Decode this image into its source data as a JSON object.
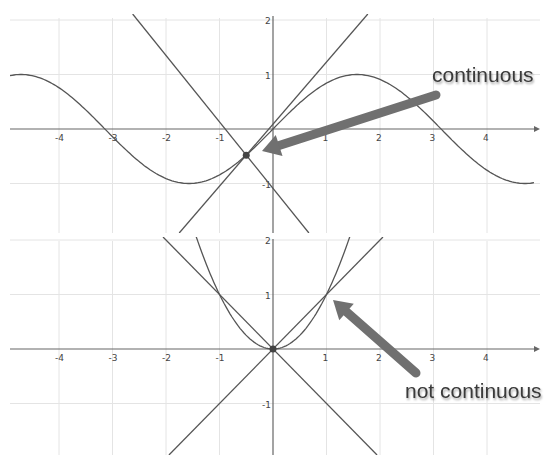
{
  "chart_data": [
    {
      "type": "line",
      "name": "top-graph",
      "title": "",
      "xlabel": "",
      "ylabel": "",
      "xlim": [
        -5,
        5
      ],
      "ylim": [
        -2,
        2
      ],
      "grid": true,
      "x_ticks": [
        -4,
        -3,
        -2,
        -1,
        1,
        2,
        3,
        4
      ],
      "y_ticks": [
        2,
        1,
        -1
      ],
      "series": [
        {
          "name": "f(x) = sin(x)",
          "kind": "function",
          "expr": "sin"
        },
        {
          "name": "line through point (slope ≈ 1.14)",
          "kind": "line",
          "slope": 1.14,
          "point": [
            -0.5,
            -0.48
          ]
        },
        {
          "name": "line through point (slope ≈ -1.22)",
          "kind": "line",
          "slope": -1.22,
          "point": [
            -0.5,
            -0.48
          ]
        }
      ],
      "points": [
        {
          "x": -0.5,
          "y": -0.48
        }
      ],
      "annotation": {
        "text": "continuous",
        "arrow_to": [
          -0.5,
          -0.48
        ]
      }
    },
    {
      "type": "line",
      "name": "bottom-graph",
      "title": "",
      "xlabel": "",
      "ylabel": "",
      "xlim": [
        -5,
        5
      ],
      "ylim": [
        -2,
        2
      ],
      "grid": true,
      "x_ticks": [
        -4,
        -3,
        -2,
        -1,
        1,
        2,
        3,
        4
      ],
      "y_ticks": [
        2,
        1,
        -1
      ],
      "series": [
        {
          "name": "f(x) = x^2",
          "kind": "function",
          "expr": "square"
        },
        {
          "name": "y = x",
          "kind": "line",
          "slope": 1,
          "point": [
            0,
            0
          ]
        },
        {
          "name": "y = -x",
          "kind": "line",
          "slope": -1,
          "point": [
            0,
            0
          ]
        }
      ],
      "points": [
        {
          "x": 0,
          "y": 0
        }
      ],
      "annotation": {
        "text": "not continuous",
        "arrow_to": [
          1,
          1
        ]
      }
    }
  ],
  "labels": {
    "top_annotation": "continuous",
    "bottom_annotation": "not continuous"
  },
  "colors": {
    "curve": "#555555",
    "grid": "#e4e4e4",
    "arrow": "#707070",
    "point": "#444444"
  }
}
